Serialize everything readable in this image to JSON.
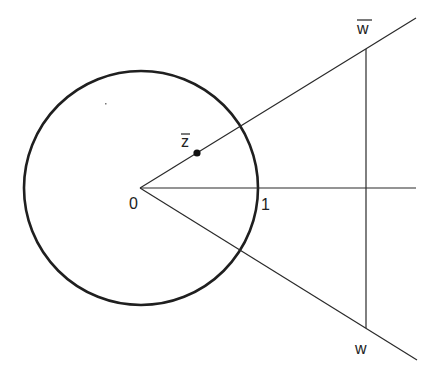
{
  "diagram": {
    "type": "geometry",
    "colors": {
      "stroke": "#2a2a2a",
      "circle": "#1f1f1f",
      "text": "#222222",
      "background": "#ffffff"
    },
    "origin": {
      "x": 140,
      "y": 188,
      "label": "0"
    },
    "unit_circle": {
      "cx": 141,
      "cy": 188,
      "r": 117,
      "stroke_width": 2.6
    },
    "real_axis": {
      "x1": 140,
      "y1": 188,
      "x2": 416,
      "y2": 188
    },
    "upper_ray": {
      "x1": 140,
      "y1": 188,
      "x2": 416,
      "y2": 18
    },
    "lower_ray": {
      "x1": 140,
      "y1": 188,
      "x2": 417,
      "y2": 360
    },
    "vertical_segment": {
      "x1": 366,
      "y1": 49,
      "x2": 366,
      "y2": 328
    },
    "point_z": {
      "x": 197,
      "y": 153,
      "r": 3.6,
      "label": "z"
    },
    "labels": {
      "origin": "0",
      "one": "1",
      "z": "z",
      "w_bar": "w",
      "w": "w"
    },
    "label_positions": {
      "origin": {
        "x": 129,
        "y": 209
      },
      "one": {
        "x": 261,
        "y": 210
      },
      "z": {
        "x": 181,
        "y": 147
      },
      "w_bar": {
        "x": 357,
        "y": 34
      },
      "w": {
        "x": 355,
        "y": 354
      }
    },
    "stray_mark": {
      "x": 105,
      "y": 103
    }
  }
}
